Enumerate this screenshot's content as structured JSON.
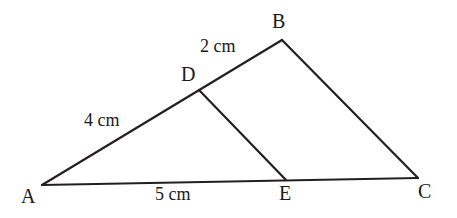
{
  "figure": {
    "type": "geometry-diagram",
    "background_color": "#ffffff",
    "stroke_color": "#231f20",
    "stroke_width": 2.2
  },
  "vertices": [
    {
      "id": "A",
      "label": "A",
      "x": 42,
      "y": 185,
      "label_x": 21,
      "label_y": 186
    },
    {
      "id": "B",
      "label": "B",
      "x": 282,
      "y": 40,
      "label_x": 272,
      "label_y": 11
    },
    {
      "id": "C",
      "label": "C",
      "x": 418,
      "y": 178,
      "label_x": 418,
      "label_y": 181
    },
    {
      "id": "D",
      "label": "D",
      "x": 199,
      "y": 90,
      "label_x": 181,
      "label_y": 64
    },
    {
      "id": "E",
      "label": "E",
      "x": 286,
      "y": 180,
      "label_x": 279,
      "label_y": 183
    }
  ],
  "segments": [
    {
      "id": "AB",
      "from": "A",
      "to": "B",
      "note": "passes through D"
    },
    {
      "id": "BC",
      "from": "B",
      "to": "C"
    },
    {
      "id": "AC",
      "from": "A",
      "to": "C",
      "note": "passes through E"
    },
    {
      "id": "DE",
      "from": "D",
      "to": "E"
    }
  ],
  "measurements": [
    {
      "id": "AD",
      "segment": "A-D",
      "text": "4 cm",
      "value": 4,
      "unit": "cm",
      "x": 84,
      "y": 111
    },
    {
      "id": "DB",
      "segment": "D-B",
      "text": "2 cm",
      "value": 2,
      "unit": "cm",
      "x": 200,
      "y": 37
    },
    {
      "id": "AE",
      "segment": "A-E",
      "text": "5 cm",
      "value": 5,
      "unit": "cm",
      "x": 155,
      "y": 185
    }
  ]
}
